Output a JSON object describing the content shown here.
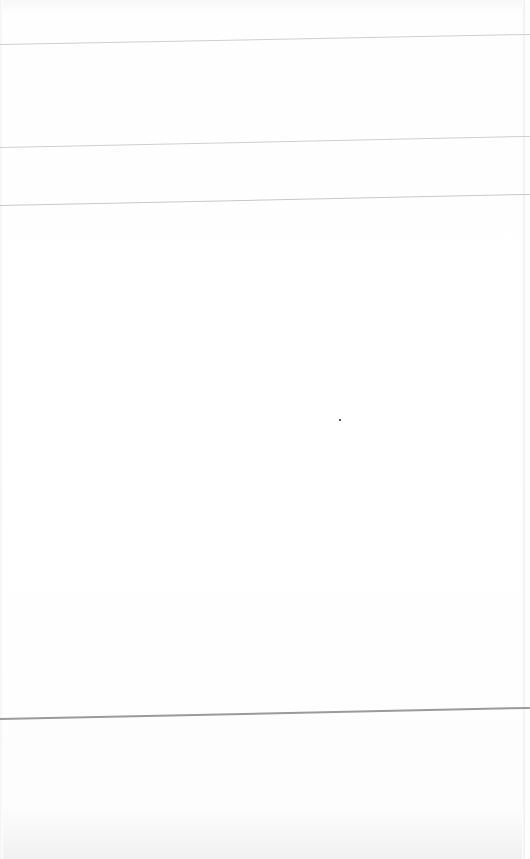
{
  "document": {
    "type": "blank ruled form (photographed)",
    "text": "",
    "rules": [
      {
        "y_left": 44,
        "y_right": 34,
        "color": "#cfcfcf"
      },
      {
        "y_left": 147,
        "y_right": 136,
        "color": "#cfcfcf"
      },
      {
        "y_left": 205,
        "y_right": 194,
        "color": "#c8c8c8"
      },
      {
        "y_left": 718,
        "y_right": 707,
        "color": "#9a9a9a"
      }
    ],
    "marks": [
      {
        "name": "stray-dot",
        "x": 339,
        "y": 419
      }
    ]
  }
}
